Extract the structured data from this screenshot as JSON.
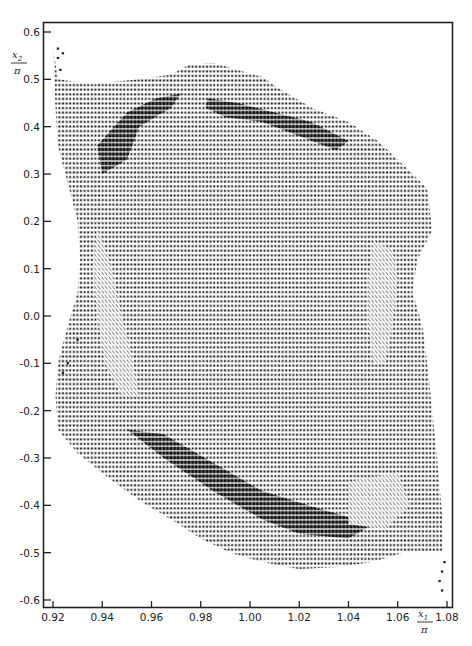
{
  "chart_data": {
    "type": "scatter",
    "title": "",
    "subtitle": "",
    "xlabel": "x1/π",
    "ylabel": "x2/π",
    "xlabel_parts": {
      "num": "x",
      "sub": "1",
      "den": "π"
    },
    "ylabel_parts": {
      "num": "x",
      "sub": "2",
      "den": "π"
    },
    "xlim": [
      0.92,
      1.08
    ],
    "ylim": [
      -0.6,
      0.6
    ],
    "x_ticks": [
      0.92,
      0.94,
      0.96,
      0.98,
      1.0,
      1.02,
      1.04,
      1.06,
      1.08
    ],
    "x_tick_labels": [
      "0.92",
      "0.94",
      "0.96",
      "0.98",
      "1.00",
      "1.02",
      "1.04",
      "1.06",
      "1.08"
    ],
    "y_ticks": [
      0.6,
      0.5,
      0.4,
      0.3,
      0.2,
      0.1,
      0.0,
      -0.1,
      -0.2,
      -0.3,
      -0.4,
      -0.5,
      -0.6
    ],
    "y_tick_labels": [
      "0.6",
      "0.5",
      "0.4",
      "0.3",
      "0.2",
      "0.1",
      "0.0",
      "-0.1",
      "-0.2",
      "-0.3",
      "-0.4",
      "-0.5",
      "-0.6"
    ],
    "grid": false,
    "legend": null,
    "marker_symbols": [
      "*",
      "▼",
      "Σ",
      "\\",
      "/"
    ],
    "filled_region_boundary": [
      [
        0.92,
        0.57
      ],
      [
        0.922,
        0.5
      ],
      [
        0.935,
        0.49
      ],
      [
        0.955,
        0.5
      ],
      [
        0.968,
        0.51
      ],
      [
        0.975,
        0.53
      ],
      [
        0.985,
        0.535
      ],
      [
        0.995,
        0.52
      ],
      [
        1.005,
        0.505
      ],
      [
        1.012,
        0.48
      ],
      [
        1.025,
        0.44
      ],
      [
        1.04,
        0.41
      ],
      [
        1.052,
        0.37
      ],
      [
        1.062,
        0.32
      ],
      [
        1.072,
        0.27
      ],
      [
        1.074,
        0.18
      ],
      [
        1.068,
        0.12
      ],
      [
        1.066,
        0.05
      ],
      [
        1.07,
        -0.02
      ],
      [
        1.072,
        -0.1
      ],
      [
        1.074,
        -0.2
      ],
      [
        1.076,
        -0.3
      ],
      [
        1.078,
        -0.42
      ],
      [
        1.078,
        -0.5
      ],
      [
        1.062,
        -0.5
      ],
      [
        1.05,
        -0.52
      ],
      [
        1.035,
        -0.53
      ],
      [
        1.02,
        -0.535
      ],
      [
        1.005,
        -0.52
      ],
      [
        0.992,
        -0.5
      ],
      [
        0.98,
        -0.47
      ],
      [
        0.968,
        -0.43
      ],
      [
        0.955,
        -0.39
      ],
      [
        0.942,
        -0.34
      ],
      [
        0.93,
        -0.29
      ],
      [
        0.922,
        -0.24
      ],
      [
        0.921,
        -0.17
      ],
      [
        0.922,
        -0.1
      ],
      [
        0.926,
        -0.02
      ],
      [
        0.93,
        0.05
      ],
      [
        0.931,
        0.12
      ],
      [
        0.93,
        0.2
      ],
      [
        0.926,
        0.28
      ],
      [
        0.922,
        0.36
      ],
      [
        0.921,
        0.44
      ]
    ],
    "dense_sigma_regions": [
      {
        "name": "upper-left-band",
        "polygon": [
          [
            0.938,
            0.36
          ],
          [
            0.95,
            0.43
          ],
          [
            0.962,
            0.46
          ],
          [
            0.972,
            0.47
          ],
          [
            0.968,
            0.44
          ],
          [
            0.955,
            0.4
          ],
          [
            0.95,
            0.33
          ],
          [
            0.94,
            0.3
          ]
        ]
      },
      {
        "name": "upper-right-band",
        "polygon": [
          [
            0.983,
            0.46
          ],
          [
            0.995,
            0.45
          ],
          [
            1.01,
            0.43
          ],
          [
            1.025,
            0.41
          ],
          [
            1.04,
            0.37
          ],
          [
            1.035,
            0.35
          ],
          [
            1.02,
            0.38
          ],
          [
            1.005,
            0.41
          ],
          [
            0.99,
            0.42
          ],
          [
            0.982,
            0.44
          ]
        ]
      },
      {
        "name": "lower-diagonal-band",
        "polygon": [
          [
            0.95,
            -0.24
          ],
          [
            0.965,
            -0.3
          ],
          [
            0.985,
            -0.37
          ],
          [
            1.005,
            -0.43
          ],
          [
            1.02,
            -0.46
          ],
          [
            1.04,
            -0.47
          ],
          [
            1.05,
            -0.44
          ],
          [
            1.03,
            -0.41
          ],
          [
            1.005,
            -0.37
          ],
          [
            0.985,
            -0.31
          ],
          [
            0.965,
            -0.25
          ]
        ]
      }
    ],
    "hatched_regions": [
      {
        "name": "left-hatch",
        "polygon": [
          [
            0.938,
            0.19
          ],
          [
            0.944,
            0.1
          ],
          [
            0.948,
            0.0
          ],
          [
            0.952,
            -0.08
          ],
          [
            0.955,
            -0.17
          ],
          [
            0.948,
            -0.17
          ],
          [
            0.941,
            -0.1
          ],
          [
            0.938,
            0.0
          ],
          [
            0.936,
            0.1
          ]
        ]
      },
      {
        "name": "right-hatch",
        "polygon": [
          [
            1.05,
            0.16
          ],
          [
            1.058,
            0.14
          ],
          [
            1.06,
            0.08
          ],
          [
            1.058,
            -0.02
          ],
          [
            1.055,
            -0.1
          ],
          [
            1.05,
            -0.1
          ],
          [
            1.048,
            -0.02
          ],
          [
            1.048,
            0.08
          ]
        ]
      },
      {
        "name": "bottom-right-hatch",
        "polygon": [
          [
            1.04,
            -0.35
          ],
          [
            1.06,
            -0.33
          ],
          [
            1.065,
            -0.4
          ],
          [
            1.055,
            -0.45
          ],
          [
            1.04,
            -0.44
          ]
        ]
      }
    ],
    "outlier_points": [
      [
        0.922,
        0.565
      ],
      [
        0.924,
        0.555
      ],
      [
        0.922,
        0.545
      ],
      [
        0.923,
        0.52
      ],
      [
        0.93,
        -0.05
      ],
      [
        0.926,
        -0.1
      ],
      [
        0.924,
        -0.12
      ],
      [
        1.078,
        -0.54
      ],
      [
        1.077,
        -0.56
      ],
      [
        1.078,
        -0.58
      ],
      [
        1.079,
        -0.52
      ]
    ]
  }
}
